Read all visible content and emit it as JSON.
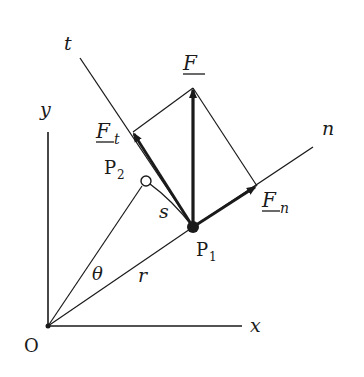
{
  "diagram": {
    "labels": {
      "origin": "O",
      "x_axis": "x",
      "y_axis": "y",
      "t_axis": "t",
      "n_axis": "n",
      "force": "F",
      "force_tangential": "F",
      "force_tangential_sub": "t",
      "force_normal": "F",
      "force_normal_sub": "n",
      "point1": "P",
      "point1_sub": "1",
      "point2": "P",
      "point2_sub": "2",
      "arc": "s",
      "angle": "θ",
      "radius": "r"
    },
    "colors": {
      "ink": "#1a1a1a",
      "background": "#ffffff"
    }
  }
}
